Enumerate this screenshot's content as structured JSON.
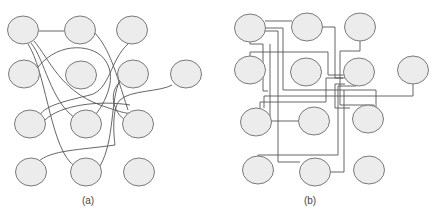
{
  "figure": {
    "panels": [
      {
        "id": "a",
        "label": "(a)",
        "label_pos": [
          88,
          202
        ],
        "routing": "curved",
        "nodes": [
          [
            23,
            30
          ],
          [
            80,
            30
          ],
          [
            132,
            30
          ],
          [
            24,
            74
          ],
          [
            81,
            75
          ],
          [
            133,
            74
          ],
          [
            186,
            74
          ],
          [
            30,
            124
          ],
          [
            86,
            124
          ],
          [
            138,
            124
          ],
          [
            31,
            172
          ],
          [
            86,
            172
          ],
          [
            139,
            172
          ]
        ],
        "edges": [
          "M39,31 L64,31",
          "M34,41 C50,60 60,90 100,105 C120,112 130,115 130,112",
          "M31,43 C45,60 50,100 75,118",
          "M28,44 C45,70 50,140 70,162 C74,166 78,168 80,162",
          "M95,33 C110,50 115,70 128,110",
          "M128,44 C110,60 110,90 90,95 C70,100 45,105 40,115",
          "M38,67 C60,40 95,45 105,60 C120,80 100,110 95,115",
          "M45,120 C60,105 100,100 130,105",
          "M172,85 C160,92 130,90 120,100 C110,110 115,145 115,145 C80,150 50,150 38,162",
          "M120,80 C110,100 115,140 100,166",
          "M120,82 C100,100 130,140 140,110"
        ]
      },
      {
        "id": "b",
        "label": "(b)",
        "label_pos": [
          310,
          202
        ],
        "routing": "orthogonal",
        "nodes": [
          [
            250,
            28
          ],
          [
            307,
            27
          ],
          [
            360,
            27
          ],
          [
            250,
            70
          ],
          [
            306,
            72
          ],
          [
            359,
            72
          ],
          [
            413,
            70
          ],
          [
            256,
            122
          ],
          [
            314,
            121
          ],
          [
            368,
            119
          ],
          [
            258,
            170
          ],
          [
            315,
            172
          ],
          [
            369,
            170
          ]
        ],
        "edges": [
          "M265,21 L292,21",
          "M265,28 L283,28 L283,90 L376,90 L376,120",
          "M265,31 L278,31 L278,162 L300,162",
          "M250,42 L250,44 L263,44 L263,91 L268,91",
          "M250,56 L250,52 L328,52 L328,75 L345,75",
          "M322,27 L335,27 L335,78 L345,78",
          "M360,41 L360,51 L340,51 L340,105 L374,105 L374,108",
          "M343,78 L326,78 L326,102 L260,102 L260,108",
          "M413,84 L413,96 L264,96 L264,108",
          "M345,84 L335,84 L335,108 L350,108",
          "M356,86 L338,86 L338,155 L258,155 L258,158",
          "M270,44 L270,121 L298,121",
          "M330,172 L344,172 L344,90"
        ]
      }
    ],
    "node_rx": 15.5,
    "node_ry": 14,
    "colors": {
      "node_fill": "#ececec",
      "node_stroke": "#7a7a7a",
      "edge_stroke": "#555555",
      "label_text": "#444444",
      "background": "#ffffff"
    }
  }
}
